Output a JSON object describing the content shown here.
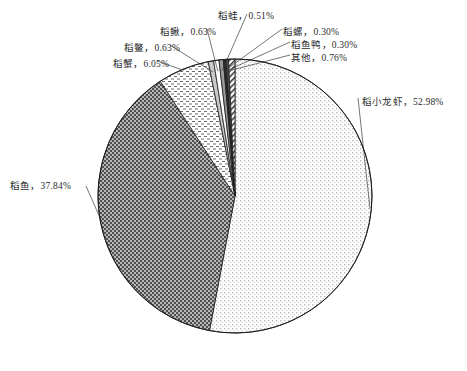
{
  "chart_data": {
    "type": "pie",
    "title": "",
    "subtitle": "",
    "xlabel": "",
    "ylabel": "",
    "legend_position": "none",
    "grid": false,
    "units": "percent",
    "start_angle_deg": 0,
    "direction": "clockwise",
    "categories": [
      "稻小龙虾",
      "稻鱼",
      "稻蟹",
      "稻鳖",
      "稻鳅",
      "稻蛙",
      "稻螺",
      "稻鱼鸭",
      "其他"
    ],
    "values": [
      52.98,
      37.84,
      6.05,
      0.63,
      0.63,
      0.51,
      0.3,
      0.3,
      0.76
    ],
    "labels": [
      {
        "name": "稻小龙虾",
        "value": 52.98,
        "text": "稻小龙虾，52.98%",
        "pattern": "fine-dots",
        "color": "#f7f7f7"
      },
      {
        "name": "稻鱼",
        "value": 37.84,
        "text": "稻鱼，37.84%",
        "pattern": "checkerboard-dark",
        "color": "#8c8c8c"
      },
      {
        "name": "稻蟹",
        "value": 6.05,
        "text": "稻蟹，6.05%",
        "pattern": "dashes",
        "color": "#fbfbfb"
      },
      {
        "name": "稻鳖",
        "value": 0.63,
        "text": "稻鳖，0.63%",
        "pattern": "light-gray",
        "color": "#c9c9c9"
      },
      {
        "name": "稻鳅",
        "value": 0.63,
        "text": "稻鳅，0.63%",
        "pattern": "white",
        "color": "#ffffff"
      },
      {
        "name": "稻蛙",
        "value": 0.51,
        "text": "稻蛙，0.51%",
        "pattern": "mid-gray",
        "color": "#9a9a9a"
      },
      {
        "name": "稻螺",
        "value": 0.3,
        "text": "稻螺，0.30%",
        "pattern": "black",
        "color": "#2a2a2a"
      },
      {
        "name": "稻鱼鸭",
        "value": 0.3,
        "text": "稻鱼鸭，0.30%",
        "pattern": "dark-gray",
        "color": "#4d4d4d"
      },
      {
        "name": "其他",
        "value": 0.76,
        "text": "其他，0.76%",
        "pattern": "diagonal-hatch",
        "color": "#ffffff"
      }
    ]
  },
  "geometry": {
    "cx": 235,
    "cy": 196,
    "r": 137
  }
}
